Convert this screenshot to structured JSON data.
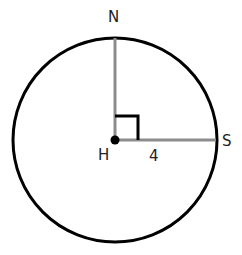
{
  "diagram": {
    "type": "circle-geometry",
    "points": {
      "center": "H",
      "top": "N",
      "right": "S"
    },
    "segment_label": "4",
    "colors": {
      "circle": "#000000",
      "radius": "#8c8c8c",
      "right_angle": "#000000"
    }
  }
}
